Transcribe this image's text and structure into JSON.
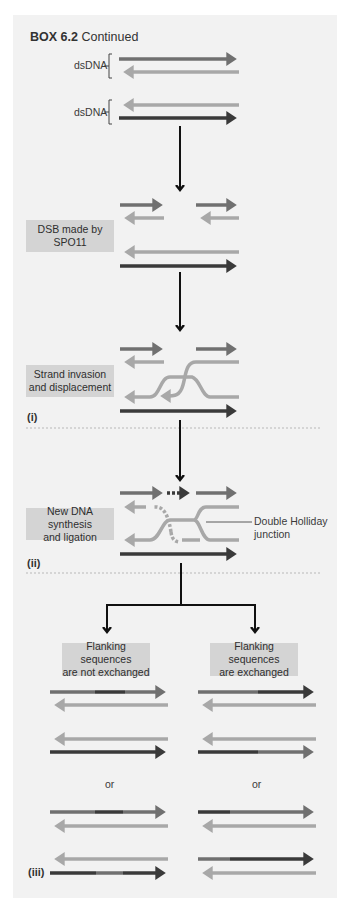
{
  "header": {
    "box_number": "BOX 6.2",
    "title": "Continued"
  },
  "labels": {
    "dsdna_1": "dsDNA",
    "dsdna_2": "dsDNA",
    "step_dsb": "DSB made by SPO11",
    "step_dsb_line1": "DSB made by",
    "step_dsb_line2": "SPO11",
    "step_invasion_line1": "Strand invasion",
    "step_invasion_line2": "and displacement",
    "step_synthesis_line1": "New DNA synthesis",
    "step_synthesis_line2": "and ligation",
    "holliday_line1": "Double Holliday",
    "holliday_line2": "junction",
    "panel_i": "(i)",
    "panel_ii": "(ii)",
    "panel_iii": "(iii)",
    "outcome_left_line1": "Flanking sequences",
    "outcome_left_line2": "are not exchanged",
    "outcome_right_line1": "Flanking sequences",
    "outcome_right_line2": "are exchanged",
    "or_left": "or",
    "or_right": "or"
  },
  "colors": {
    "background": "#f2f2f2",
    "strand_medium": "#707070",
    "strand_light": "#a8a8a8",
    "strand_dark": "#3a3a3a",
    "label_box": "#d4d4d4",
    "flow_arrow": "#111111"
  }
}
